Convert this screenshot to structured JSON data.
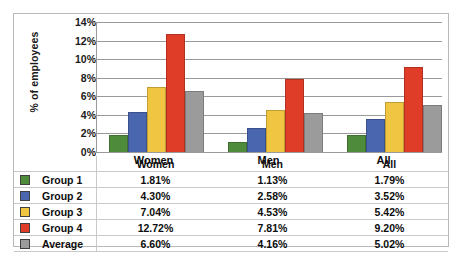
{
  "chart_data": {
    "type": "bar",
    "title": "",
    "xlabel": "",
    "ylabel": "% of employees",
    "categories": [
      "Women",
      "Men",
      "All"
    ],
    "series": [
      {
        "name": "Group 1",
        "color": "#4e8b3b",
        "values": [
          1.81,
          1.13,
          1.79
        ]
      },
      {
        "name": "Group 2",
        "color": "#4a66ae",
        "values": [
          4.3,
          2.58,
          3.52
        ]
      },
      {
        "name": "Group 3",
        "color": "#f0c542",
        "values": [
          7.04,
          4.53,
          5.42
        ]
      },
      {
        "name": "Group 4",
        "color": "#e03d28",
        "values": [
          12.72,
          7.81,
          9.2
        ]
      },
      {
        "name": "Average",
        "color": "#9b9b9b",
        "values": [
          6.6,
          4.16,
          5.02
        ]
      }
    ],
    "ylim": [
      0,
      14
    ],
    "yticks": [
      "0%",
      "2%",
      "4%",
      "6%",
      "8%",
      "10%",
      "12%",
      "14%"
    ],
    "ytick_values": [
      0,
      2,
      4,
      6,
      8,
      10,
      12,
      14
    ],
    "grid": true,
    "legend_position": "table-below"
  },
  "table": {
    "header": [
      "",
      "",
      "Women",
      "Men",
      "All"
    ],
    "rows": [
      {
        "label": "Group 1",
        "color": "#4e8b3b",
        "values": [
          "1.81%",
          "1.13%",
          "1.79%"
        ]
      },
      {
        "label": "Group 2",
        "color": "#4a66ae",
        "values": [
          "4.30%",
          "2.58%",
          "3.52%"
        ]
      },
      {
        "label": "Group 3",
        "color": "#f0c542",
        "values": [
          "7.04%",
          "4.53%",
          "5.42%"
        ]
      },
      {
        "label": "Group 4",
        "color": "#e03d28",
        "values": [
          "12.72%",
          "7.81%",
          "9.20%"
        ]
      },
      {
        "label": "Average",
        "color": "#9b9b9b",
        "values": [
          "6.60%",
          "4.16%",
          "5.02%"
        ]
      }
    ]
  }
}
